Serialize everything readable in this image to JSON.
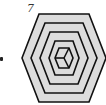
{
  "figure": {
    "label": "7",
    "colors": {
      "fill": "#dcdcdc",
      "stroke": "#111111",
      "background": "#ffffff"
    },
    "center": {
      "x": 64,
      "y": 58
    },
    "rings": [
      {
        "rx": 42,
        "ry": 44,
        "tx": 25
      },
      {
        "rx": 33,
        "ry": 35,
        "tx": 19
      },
      {
        "rx": 24,
        "ry": 26,
        "tx": 14
      },
      {
        "rx": 15,
        "ry": 17,
        "tx": 9
      },
      {
        "rx": 9,
        "ry": 10,
        "tx": 5
      }
    ],
    "cube_spokes": [
      "left",
      "upper-right",
      "lower-right"
    ]
  }
}
